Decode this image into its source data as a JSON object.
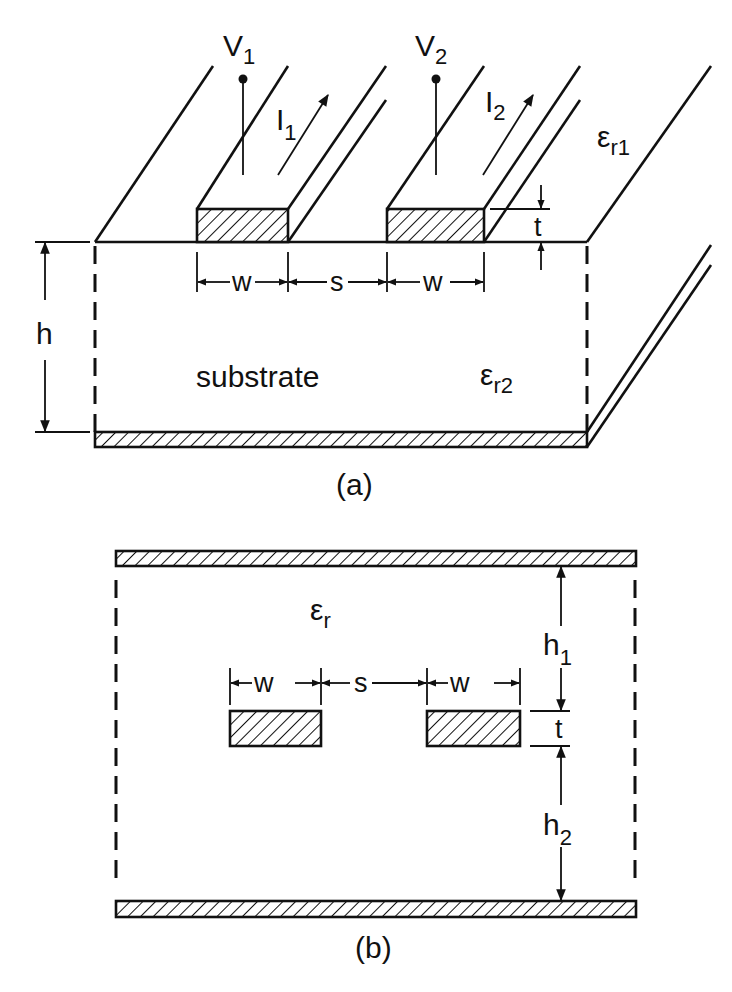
{
  "figure_a": {
    "caption": "(a)",
    "voltage_1": {
      "base": "V",
      "sub": "1"
    },
    "voltage_2": {
      "base": "V",
      "sub": "2"
    },
    "current_1": {
      "base": "I",
      "sub": "1"
    },
    "current_2": {
      "base": "I",
      "sub": "2"
    },
    "eps_upper": {
      "base": "ε",
      "sub": "r1"
    },
    "eps_substrate": {
      "base": "ε",
      "sub": "r2"
    },
    "substrate_label": "substrate",
    "dim_w": "w",
    "dim_s": "s",
    "dim_t": "t",
    "dim_h": "h"
  },
  "figure_b": {
    "caption": "(b)",
    "eps": {
      "base": "ε",
      "sub": "r"
    },
    "dim_w": "w",
    "dim_s": "s",
    "dim_t": "t",
    "dim_h1": {
      "base": "h",
      "sub": "1"
    },
    "dim_h2": {
      "base": "h",
      "sub": "2"
    }
  }
}
